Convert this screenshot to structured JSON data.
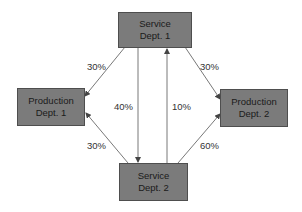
{
  "diagram": {
    "nodes": {
      "service1": {
        "line1": "Service",
        "line2": "Dept. 1"
      },
      "production1": {
        "line1": "Production",
        "line2": "Dept. 1"
      },
      "production2": {
        "line1": "Production",
        "line2": "Dept. 2"
      },
      "service2": {
        "line1": "Service",
        "line2": "Dept. 2"
      }
    },
    "edges": {
      "s1_to_p1": "30%",
      "s1_to_s2": "40%",
      "s2_to_s1": "10%",
      "s1_to_p2": "30%",
      "s2_to_p1": "30%",
      "s2_to_p2": "60%"
    },
    "colors": {
      "box_fill": "#7b7b7b",
      "box_border": "#4e4e4e",
      "line": "#555555"
    }
  }
}
